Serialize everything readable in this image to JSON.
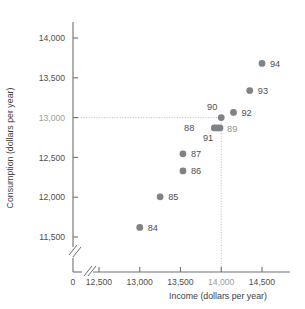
{
  "chart_data": {
    "type": "scatter",
    "title": "",
    "xlabel": "Income (dollars per year)",
    "ylabel": "Consumption (dollars per year)",
    "xlim": [
      12250,
      14700
    ],
    "ylim": [
      11350,
      14150
    ],
    "grid": false,
    "legend": "none",
    "axis_breaks": {
      "x": true,
      "y": true
    },
    "xticks": [
      {
        "label": "0",
        "value": 0,
        "muted": false
      },
      {
        "label": "12,500",
        "value": 12500,
        "muted": false
      },
      {
        "label": "13,000",
        "value": 13000,
        "muted": false
      },
      {
        "label": "13,500",
        "value": 13500,
        "muted": false
      },
      {
        "label": "14,000",
        "value": 14000,
        "muted": true
      },
      {
        "label": "14,500",
        "value": 14500,
        "muted": false
      }
    ],
    "yticks": [
      {
        "label": "11,500",
        "value": 11500,
        "muted": false
      },
      {
        "label": "12,000",
        "value": 12000,
        "muted": false
      },
      {
        "label": "12,500",
        "value": 12500,
        "muted": false
      },
      {
        "label": "13,000",
        "value": 13000,
        "muted": true
      },
      {
        "label": "13,500",
        "value": 13500,
        "muted": false
      },
      {
        "label": "14,000",
        "value": 14000,
        "muted": false
      }
    ],
    "annotations": [
      {
        "name": "reference-line-consumption-13000",
        "orientation": "horizontal",
        "value": 13000
      },
      {
        "name": "reference-line-income-14000",
        "orientation": "vertical",
        "value": 14000
      }
    ],
    "marker_color": "#808285",
    "points": [
      {
        "label": "84",
        "x": 13000,
        "y": 11620,
        "label_dx": 8,
        "label_dy": 3.4,
        "muted": false
      },
      {
        "label": "85",
        "x": 13250,
        "y": 12005,
        "label_dx": 8,
        "label_dy": 3.4,
        "muted": false
      },
      {
        "label": "86",
        "x": 13530,
        "y": 12330,
        "label_dx": 8,
        "label_dy": 3.4,
        "muted": false
      },
      {
        "label": "87",
        "x": 13530,
        "y": 12545,
        "label_dx": 8,
        "label_dy": 3.4,
        "muted": false
      },
      {
        "label": "88",
        "x": 13915,
        "y": 12870,
        "label_dx": -20,
        "label_dy": 3.4,
        "muted": false
      },
      {
        "label": "89",
        "x": 13985,
        "y": 12870,
        "label_dx": 7,
        "label_dy": 3.8,
        "muted": true
      },
      {
        "label": "90",
        "x": 14000,
        "y": 13000,
        "label_dx": -4,
        "label_dy": -7.5,
        "muted": false
      },
      {
        "label": "91",
        "x": 13950,
        "y": 12870,
        "label_dx": -4,
        "label_dy": 13.5,
        "muted": false
      },
      {
        "label": "92",
        "x": 14150,
        "y": 13065,
        "label_dx": 8,
        "label_dy": 3.4,
        "muted": false
      },
      {
        "label": "93",
        "x": 14350,
        "y": 13340,
        "label_dx": 8,
        "label_dy": 3.4,
        "muted": false
      },
      {
        "label": "94",
        "x": 14500,
        "y": 13680,
        "label_dx": 8,
        "label_dy": 3.4,
        "muted": false
      }
    ]
  }
}
